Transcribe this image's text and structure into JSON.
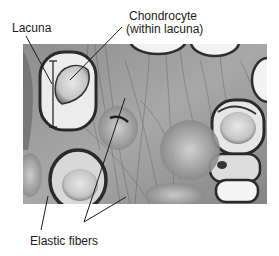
{
  "figure": {
    "labels": {
      "lacuna": "Lacuna",
      "chondrocyte_line1": "Chondrocyte",
      "chondrocyte_line2": "(within lacuna)",
      "elastic_fibers": "Elastic fibers"
    },
    "colors": {
      "background": "#ffffff",
      "matrix": "#9a9a9a",
      "lacuna_fill": "#ececec",
      "cell_rim": "#3a3a3a",
      "leader_line": "#1a1a1a"
    }
  }
}
